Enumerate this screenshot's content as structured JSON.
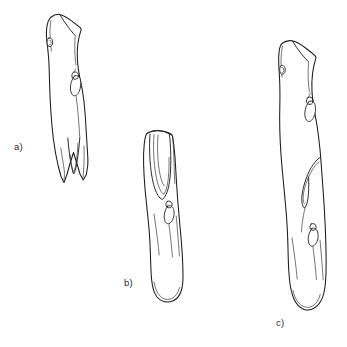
{
  "figure": {
    "kind": "scientific-line-drawing",
    "medium": "ink line drawing",
    "background_color": "#ffffff",
    "line_color": "#1a1a1a",
    "panel_count": 3
  },
  "labels": {
    "a": "a)",
    "b": "b)",
    "c": "c)"
  },
  "panels": [
    {
      "id": "a",
      "label": "a)",
      "position": "upper-left",
      "orientation": "near-vertical, tilted slightly right at top",
      "description": "Slender elongated artifact with an angular faceted proximal end at top, a small oval nodule on the left edge near the top, a teardrop loop feature on the right edge at mid-height, and a deep narrow V-shaped split or notch at the distal (lower) end.",
      "features": [
        "angular faceted proximal end",
        "small oval nodule on left margin",
        "teardrop loop on right margin",
        "deep V-shaped distal split"
      ]
    },
    {
      "id": "b",
      "label": "b)",
      "position": "lower-center",
      "orientation": "near-vertical, tilted slightly right",
      "description": "Shorter elongated artifact with a deep narrow U-shaped groove descending from the flat proximal end at top, a small heart-shaped nodule low on the shaft with a fine incised line running beneath it, and a smoothly rounded distal end.",
      "features": [
        "flat proximal end",
        "deep U-shaped longitudinal groove",
        "heart-shaped nodule on shaft",
        "fine incised line below nodule",
        "rounded distal end"
      ]
    },
    {
      "id": "c",
      "label": "c)",
      "position": "right",
      "orientation": "near-vertical, tilted slightly right at top",
      "description": "Longest of the three artifacts, with an angular faceted proximal end at top, a small oval nodule on the left margin, a teardrop loop on the right margin near the top, a long hooked or J-shaped groove along the mid shaft, a heart-shaped nodule with a fine incised line below it, and a rounded distal end.",
      "features": [
        "angular faceted proximal end",
        "oval nodule on left margin",
        "teardrop loop on right margin",
        "long hooked J-shaped groove",
        "heart-shaped nodule with incised line",
        "rounded distal end"
      ]
    }
  ]
}
